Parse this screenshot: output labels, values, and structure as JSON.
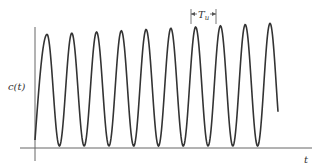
{
  "figure": {
    "y_label": "c(t)",
    "x_label": "t",
    "period_label": "T",
    "period_subscript": "u"
  },
  "style": {
    "curve_color": "#333333",
    "axis_color": "#666666"
  },
  "chart_data": {
    "type": "line",
    "title": "",
    "xlabel": "t",
    "ylabel": "c(t)",
    "annotations": [
      {
        "text": "T_u",
        "meaning": "period between successive peaks"
      }
    ],
    "series": [
      {
        "name": "c(t)",
        "shape": "sustained oscillation, ~9.3 cycles, slightly growing amplitude",
        "peaks": 10
      }
    ],
    "grid": false,
    "legend": "none"
  }
}
